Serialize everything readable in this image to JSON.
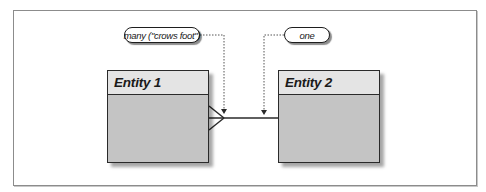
{
  "diagram": {
    "type": "entity-relationship",
    "notation": "crow's foot",
    "entities": [
      {
        "id": "entity1",
        "name": "Entity 1"
      },
      {
        "id": "entity2",
        "name": "Entity 2"
      }
    ],
    "relationship": {
      "from": "entity1",
      "to": "entity2",
      "from_cardinality": "many",
      "to_cardinality": "one"
    },
    "annotations": [
      {
        "label": "many (\"crows foot\")",
        "points_to": "crow's foot end at Entity 1"
      },
      {
        "label": "one",
        "points_to": "plain line end at Entity 2"
      }
    ]
  },
  "colors": {
    "entity_header": "#e4e4e4",
    "entity_body": "#c4c4c4",
    "outline": "#2a2a2a",
    "frame": "#8c8c8c",
    "background": "#ffffff"
  }
}
